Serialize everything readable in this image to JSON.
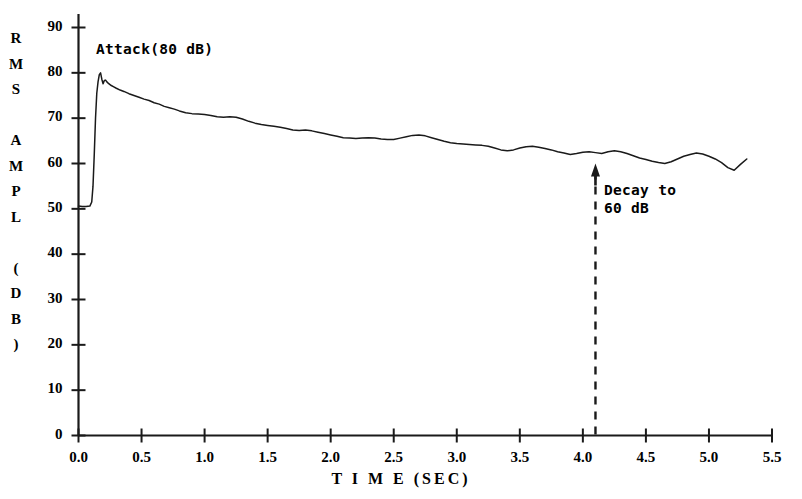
{
  "chart_data": {
    "type": "line",
    "title": "",
    "xlabel": "T I M E (SEC)",
    "ylabel": "R M S  A M P L  ( D B )",
    "ylabel_chars": [
      "R",
      "M",
      "S",
      "",
      "A",
      "M",
      "P",
      "L",
      "",
      "(",
      "D",
      "B",
      ")"
    ],
    "xlim": [
      0.0,
      5.5
    ],
    "ylim": [
      0,
      90
    ],
    "xticks": [
      "0.0",
      "0.5",
      "1.0",
      "1.5",
      "2.0",
      "2.5",
      "3.0",
      "3.5",
      "4.0",
      "4.5",
      "5.0",
      "5.5"
    ],
    "xtick_values": [
      0.0,
      0.5,
      1.0,
      1.5,
      2.0,
      2.5,
      3.0,
      3.5,
      4.0,
      4.5,
      5.0,
      5.5
    ],
    "yticks": [
      "0",
      "10",
      "20",
      "30",
      "40",
      "50",
      "60",
      "70",
      "80",
      "90"
    ],
    "ytick_values": [
      0,
      10,
      20,
      30,
      40,
      50,
      60,
      70,
      80,
      90
    ],
    "grid": false,
    "legend": null,
    "line_color": "#1a1a1a",
    "axis_color": "#1a1a1a",
    "background": "#ffffff",
    "annotations": [
      {
        "name": "attack-annotation",
        "text": "Attack(80 dB)",
        "x": 0.15,
        "y": 80,
        "note": "labels the initial onset peak at 80 dB"
      },
      {
        "name": "decay-annotation",
        "text": "Decay to\n60 dB",
        "line1": "Decay to",
        "line2": "60 dB",
        "x": 4.1,
        "y": 60,
        "marker": "up-arrow with dashed vertical drop line to x-axis",
        "note": "marks the time at which the RMS amplitude has decayed to 60 dB"
      }
    ],
    "series": [
      {
        "name": "RMS amplitude",
        "x": [
          0.0,
          0.03,
          0.06,
          0.09,
          0.105,
          0.115,
          0.125,
          0.135,
          0.145,
          0.155,
          0.165,
          0.175,
          0.185,
          0.195,
          0.205,
          0.215,
          0.225,
          0.24,
          0.26,
          0.28,
          0.3,
          0.33,
          0.36,
          0.4,
          0.44,
          0.48,
          0.52,
          0.56,
          0.6,
          0.64,
          0.68,
          0.72,
          0.76,
          0.8,
          0.85,
          0.9,
          0.95,
          1.0,
          1.05,
          1.1,
          1.15,
          1.2,
          1.25,
          1.3,
          1.35,
          1.4,
          1.45,
          1.5,
          1.55,
          1.6,
          1.65,
          1.7,
          1.75,
          1.8,
          1.85,
          1.9,
          1.95,
          2.0,
          2.05,
          2.1,
          2.15,
          2.2,
          2.25,
          2.3,
          2.35,
          2.4,
          2.45,
          2.5,
          2.55,
          2.6,
          2.65,
          2.7,
          2.75,
          2.8,
          2.85,
          2.9,
          2.95,
          3.0,
          3.05,
          3.1,
          3.15,
          3.2,
          3.25,
          3.3,
          3.35,
          3.4,
          3.45,
          3.5,
          3.55,
          3.6,
          3.65,
          3.7,
          3.75,
          3.8,
          3.85,
          3.9,
          3.95,
          4.0,
          4.05,
          4.1,
          4.15,
          4.2,
          4.25,
          4.3,
          4.35,
          4.4,
          4.45,
          4.5,
          4.55,
          4.6,
          4.65,
          4.7,
          4.75,
          4.8,
          4.85,
          4.9,
          4.95,
          5.0,
          5.05,
          5.1,
          5.15,
          5.2,
          5.25,
          5.3
        ],
        "y": [
          50.6,
          50.5,
          50.5,
          50.6,
          51.5,
          55.0,
          62.0,
          70.0,
          75.5,
          78.0,
          79.6,
          80.0,
          78.6,
          77.6,
          78.3,
          78.4,
          78.0,
          77.6,
          77.2,
          76.9,
          76.6,
          76.2,
          75.9,
          75.4,
          75.0,
          74.6,
          74.2,
          73.9,
          73.4,
          73.1,
          72.6,
          72.3,
          72.0,
          71.6,
          71.2,
          71.0,
          70.9,
          70.8,
          70.6,
          70.3,
          70.2,
          70.3,
          70.2,
          69.8,
          69.3,
          68.9,
          68.6,
          68.4,
          68.2,
          68.0,
          67.7,
          67.4,
          67.3,
          67.4,
          67.2,
          66.9,
          66.6,
          66.3,
          66.0,
          65.7,
          65.6,
          65.5,
          65.6,
          65.7,
          65.6,
          65.4,
          65.3,
          65.3,
          65.6,
          65.9,
          66.2,
          66.3,
          66.1,
          65.7,
          65.3,
          64.9,
          64.6,
          64.4,
          64.3,
          64.2,
          64.1,
          64.0,
          63.8,
          63.4,
          63.0,
          62.8,
          63.0,
          63.4,
          63.7,
          63.8,
          63.6,
          63.3,
          63.0,
          62.6,
          62.3,
          62.0,
          62.2,
          62.5,
          62.6,
          62.4,
          62.2,
          62.6,
          62.8,
          62.6,
          62.2,
          61.7,
          61.2,
          60.9,
          60.5,
          60.2,
          60.0,
          60.4,
          61.0,
          61.6,
          62.0,
          62.3,
          62.1,
          61.6,
          61.0,
          60.2,
          59.1,
          58.5,
          59.8,
          61.0
        ],
        "units": "dB",
        "noise_floor": 50.5,
        "peak": 80.0,
        "peak_time": 0.175,
        "decay_to_60db_time": 4.1
      }
    ]
  },
  "axis": {
    "y_axis_name": "y-axis",
    "x_axis_name": "x-axis"
  }
}
